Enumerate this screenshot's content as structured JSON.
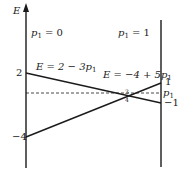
{
  "diagram": {
    "axis_label": "E",
    "left_axis_label": "p",
    "left_axis_sub": "1",
    "left_axis_value": " = 0",
    "right_axis_label": "p",
    "right_axis_sub": "1",
    "right_axis_value": " = 1",
    "line_a": {
      "prefix": "E = 2 − 3",
      "var": "p",
      "sub": "1"
    },
    "line_b": {
      "prefix": "E = −4 + 5",
      "var": "p",
      "sub": "1"
    },
    "left_ticks": {
      "top": "2",
      "bottom": "−4"
    },
    "right_ticks": {
      "top": "1",
      "bottom": "−1"
    },
    "dashed_label": {
      "var": "p",
      "sub": "1"
    },
    "intersection": {
      "num": "3",
      "den": "4"
    },
    "colors": {
      "line": "#1a1a1a",
      "background": "#ffffff"
    }
  }
}
